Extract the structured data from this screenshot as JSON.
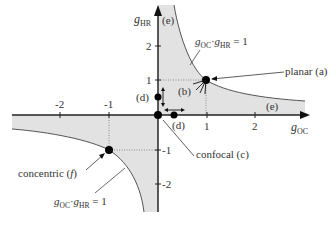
{
  "diagram": {
    "axes": {
      "x_label": "g",
      "x_label_sub": "OC",
      "y_label": "g",
      "y_label_sub": "HR",
      "x_ticks": [
        "-2",
        "-1",
        "1",
        "2"
      ],
      "y_ticks": [
        "2",
        "1",
        "-1",
        "-2"
      ]
    },
    "curve_label_top": {
      "g1": "g",
      "s1": "OC",
      "dot": "·",
      "g2": "g",
      "s2": "HR",
      "eq": " = 1"
    },
    "curve_label_bottom": {
      "g1": "g",
      "s1": "OC",
      "dot": "·",
      "g2": "g",
      "s2": "HR",
      "eq": " = 1"
    },
    "points": {
      "planar": "planar (a)",
      "b": "(b)",
      "confocal": "confocal (c)",
      "d_vertical": "(d)",
      "d_horizontal": "(d)",
      "e_top": "(e)",
      "e_right": "(e)",
      "concentric": "concentric (",
      "concentric_f": "f",
      "concentric_close": ")"
    },
    "colors": {
      "stable_region": "#e2e2e2",
      "axis": "#222222",
      "curve": "#444444"
    }
  }
}
